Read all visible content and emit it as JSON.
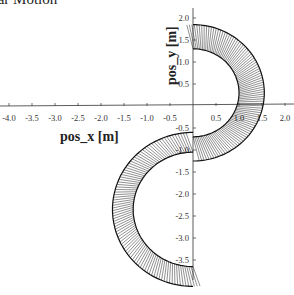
{
  "title": "ular Motion",
  "chart_data": {
    "type": "line",
    "xlabel": "pos_x [m]",
    "ylabel": "pos_y [m]",
    "xlim": [
      -4.0,
      2.0
    ],
    "ylim": [
      -3.8,
      2.2
    ],
    "x_ticks": [
      "-4.0",
      "-3.5",
      "-3.0",
      "-2.5",
      "-2.0",
      "-1.5",
      "-1.0",
      "-0.5",
      "0.5",
      "1.0",
      "1.5",
      "2.0"
    ],
    "y_ticks": [
      "2.0",
      "1.5",
      "1.0",
      "0.5",
      "-0.5",
      "-1.0",
      "-1.5",
      "-2.0",
      "-2.5",
      "-3.0",
      "-3.5"
    ],
    "grid": false,
    "series": [
      {
        "name": "upper arc",
        "center": [
          0,
          0.3
        ],
        "r_inner": 1.0,
        "r_outer": 1.55,
        "angle_range_deg": [
          -90,
          90
        ]
      },
      {
        "name": "lower arc",
        "center": [
          0,
          -2.35
        ],
        "r_inner": 1.3,
        "r_outer": 1.75,
        "angle_range_deg": [
          90,
          270
        ]
      }
    ]
  }
}
